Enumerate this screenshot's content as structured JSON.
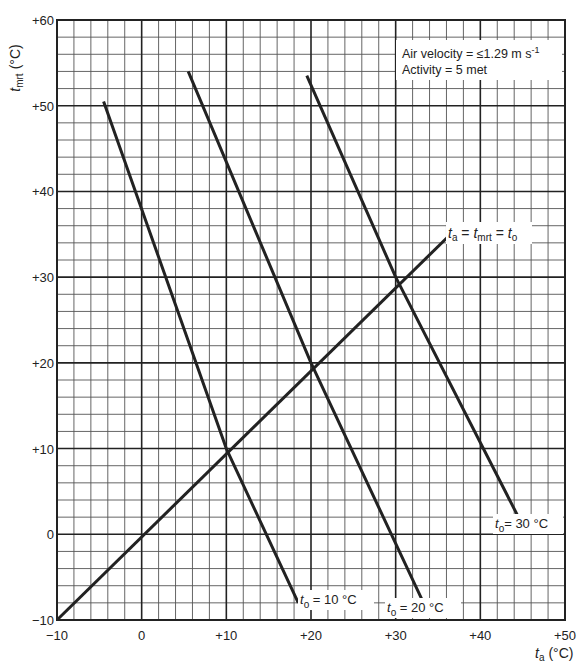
{
  "chart_data": {
    "type": "line",
    "title": "",
    "xlabel": "t_a (°C)",
    "ylabel": "t_mrt (°C)",
    "xlim": [
      -10,
      50
    ],
    "ylim": [
      -10,
      60
    ],
    "x_ticks": [
      "-10",
      "0",
      "+10",
      "+20",
      "+30",
      "+40",
      "+50"
    ],
    "y_ticks": [
      "-10",
      "0",
      "+10",
      "+20",
      "+30",
      "+40",
      "+50",
      "+60"
    ],
    "grid": true,
    "grid_minor_step": 2,
    "grid_major_step": 10,
    "annotations": [
      "Air velocity = ≤1.29 m s⁻¹",
      "Activity = 5 met"
    ],
    "series": [
      {
        "name": "t_o = 10 °C",
        "points": [
          [
            -4.5,
            50.5
          ],
          [
            10,
            10
          ],
          [
            18.5,
            -8
          ]
        ]
      },
      {
        "name": "t_o = 20 °C",
        "points": [
          [
            5.5,
            54
          ],
          [
            20,
            20
          ],
          [
            34,
            -9.5
          ]
        ]
      },
      {
        "name": "t_o = 30 °C",
        "points": [
          [
            19.5,
            53.5
          ],
          [
            30,
            30
          ],
          [
            44.5,
            2
          ]
        ]
      },
      {
        "name": "t_a = t_mrt = t_o",
        "points": [
          [
            -10,
            -10
          ],
          [
            37,
            35.5
          ]
        ],
        "arrow": true
      }
    ]
  },
  "labels": {
    "y_axis_main": "t",
    "y_axis_sub": "mrt",
    "y_axis_unit": "(°C)",
    "x_axis_main": "t",
    "x_axis_sub": "a",
    "x_axis_unit": "(°C)",
    "note_line1": "Air velocity = ≤1.29 m s",
    "note_line1_sup": "-1",
    "note_line2": "Activity  =  5 met",
    "diag_t1": "t",
    "diag_s1": "a",
    "diag_eq1": " = ",
    "diag_t2": "t",
    "diag_s2": "mrt",
    "diag_eq2": " = ",
    "diag_t3": "t",
    "diag_s3": "o",
    "to10_t": "t",
    "to10_s": "o",
    "to10_v": " = 10 °C",
    "to20_t": "t",
    "to20_s": "o",
    "to20_v": " = 20 °C",
    "to30_t": "t",
    "to30_s": "o",
    "to30_v": "= 30 °C"
  }
}
